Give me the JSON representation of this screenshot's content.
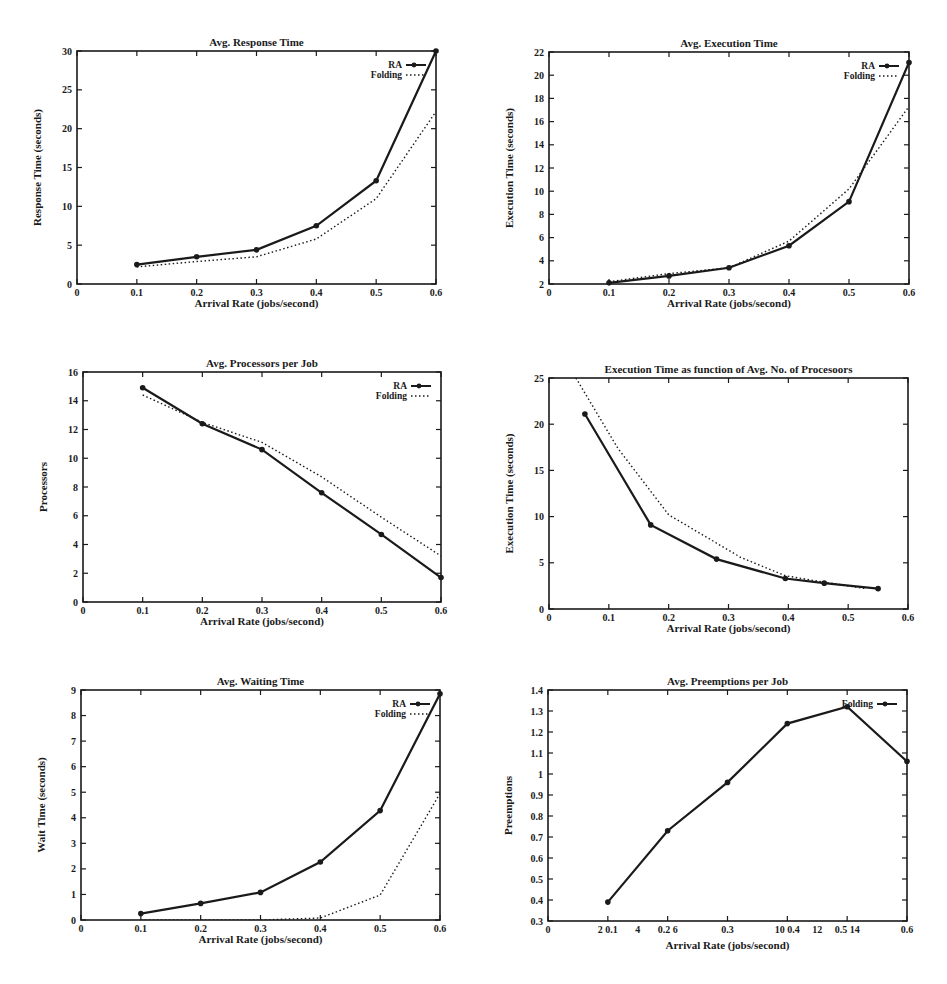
{
  "chart_data": [
    {
      "id": "avg-response-time",
      "type": "line",
      "title": "Avg. Response Time",
      "xlabel": "Arrival Rate (jobs/second)",
      "ylabel": "Response Time (seconds)",
      "xlim": [
        0,
        0.6
      ],
      "ylim": [
        0,
        30
      ],
      "xticks": [
        0,
        0.1,
        0.2,
        0.3,
        0.4,
        0.5,
        0.6
      ],
      "xtick_labels": [
        "0",
        "0.1",
        "0.2",
        "0.3",
        "0.4",
        "0.5",
        "0.6"
      ],
      "yticks": [
        0,
        5,
        10,
        15,
        20,
        25,
        30
      ],
      "ytick_labels": [
        "0",
        "5",
        "10",
        "15",
        "20",
        "25",
        "30"
      ],
      "grid": false,
      "legend_position": "top-right",
      "series": [
        {
          "name": "RA",
          "style": "solid-marker",
          "x": [
            0.1,
            0.2,
            0.3,
            0.4,
            0.5,
            0.6
          ],
          "y": [
            2.5,
            3.5,
            4.4,
            7.5,
            13.3,
            30.0
          ]
        },
        {
          "name": "Folding",
          "style": "dotted",
          "x": [
            0.1,
            0.2,
            0.3,
            0.4,
            0.5,
            0.6
          ],
          "y": [
            2.2,
            2.9,
            3.5,
            5.8,
            11.0,
            22.2
          ]
        }
      ]
    },
    {
      "id": "avg-execution-time",
      "type": "line",
      "title": "Avg. Execution Time",
      "xlabel": "Arrival Rate (jobs/second)",
      "ylabel": "Execution Time (seconds)",
      "xlim": [
        0,
        0.6
      ],
      "ylim": [
        2,
        22
      ],
      "xticks": [
        0,
        0.1,
        0.2,
        0.3,
        0.4,
        0.5,
        0.6
      ],
      "xtick_labels": [
        "0",
        "0.1",
        "0.2",
        "0.3",
        "0.4",
        "0.5",
        "0.6"
      ],
      "yticks": [
        2,
        4,
        6,
        8,
        10,
        12,
        14,
        16,
        18,
        20,
        22
      ],
      "ytick_labels": [
        "2",
        "4",
        "6",
        "8",
        "10",
        "12",
        "14",
        "16",
        "18",
        "20",
        "22"
      ],
      "grid": false,
      "legend_position": "top-right",
      "series": [
        {
          "name": "RA",
          "style": "solid-marker",
          "x": [
            0.1,
            0.2,
            0.3,
            0.4,
            0.5,
            0.6
          ],
          "y": [
            2.1,
            2.7,
            3.4,
            5.3,
            9.1,
            21.1
          ]
        },
        {
          "name": "Folding",
          "style": "dotted",
          "x": [
            0.1,
            0.2,
            0.3,
            0.4,
            0.5,
            0.6
          ],
          "y": [
            2.2,
            2.9,
            3.4,
            5.7,
            10.2,
            17.3
          ]
        }
      ]
    },
    {
      "id": "avg-processors-per-job",
      "type": "line",
      "title": "Avg. Processors per Job",
      "xlabel": "Arrival Rate (jobs/second)",
      "ylabel": "Processors",
      "xlim": [
        0,
        0.6
      ],
      "ylim": [
        0,
        16
      ],
      "xticks": [
        0,
        0.1,
        0.2,
        0.3,
        0.4,
        0.5,
        0.6
      ],
      "xtick_labels": [
        "0",
        "0.1",
        "0.2",
        "0.3",
        "0.4",
        "0.5",
        "0.6"
      ],
      "yticks": [
        0,
        2,
        4,
        6,
        8,
        10,
        12,
        14,
        16
      ],
      "ytick_labels": [
        "0",
        "2",
        "4",
        "6",
        "8",
        "10",
        "12",
        "14",
        "16"
      ],
      "grid": false,
      "legend_position": "top-right",
      "series": [
        {
          "name": "RA",
          "style": "solid-marker",
          "x": [
            0.1,
            0.2,
            0.3,
            0.4,
            0.5,
            0.6
          ],
          "y": [
            14.9,
            12.4,
            10.6,
            7.6,
            4.7,
            1.7
          ]
        },
        {
          "name": "Folding",
          "style": "dotted",
          "x": [
            0.1,
            0.2,
            0.3,
            0.4,
            0.5,
            0.6
          ],
          "y": [
            14.4,
            12.5,
            11.1,
            8.7,
            5.9,
            3.2
          ]
        }
      ]
    },
    {
      "id": "execution-time-vs-processors",
      "type": "line",
      "title": "Execution Time as function of Avg. No. of Procesoors",
      "xlabel": "Arrival Rate (jobs/second)",
      "ylabel": "Execution Time (seconds)",
      "xlim": [
        0,
        0.6
      ],
      "ylim": [
        0,
        25
      ],
      "xticks": [
        0,
        0.1,
        0.2,
        0.3,
        0.4,
        0.5,
        0.6
      ],
      "xtick_labels": [
        "0",
        "0.1",
        "0.2",
        "0.3",
        "0.4",
        "0.5",
        "0.6"
      ],
      "yticks": [
        0,
        5,
        10,
        15,
        20,
        25
      ],
      "ytick_labels": [
        "0",
        "5",
        "10",
        "15",
        "20",
        "25"
      ],
      "grid": false,
      "legend_position": "none",
      "series": [
        {
          "name": "RA",
          "style": "solid-marker",
          "x": [
            0.06,
            0.17,
            0.28,
            0.395,
            0.46,
            0.55
          ],
          "y": [
            21.1,
            9.1,
            5.4,
            3.3,
            2.8,
            2.2
          ]
        },
        {
          "name": "Folding",
          "style": "dotted",
          "x": [
            0.045,
            0.115,
            0.2,
            0.32,
            0.395,
            0.46,
            0.53
          ],
          "y": [
            25.0,
            17.4,
            10.2,
            5.6,
            3.6,
            2.9,
            2.2
          ]
        }
      ]
    },
    {
      "id": "avg-waiting-time",
      "type": "line",
      "title": "Avg. Waiting Time",
      "xlabel": "Arrival Rate (jobs/second)",
      "ylabel": "Wait Time (seconds)",
      "xlim": [
        0,
        0.6
      ],
      "ylim": [
        0,
        9
      ],
      "xticks": [
        0,
        0.1,
        0.2,
        0.3,
        0.4,
        0.5,
        0.6
      ],
      "xtick_labels": [
        "0",
        "0.1",
        "0.2",
        "0.3",
        "0.4",
        "0.5",
        "0.6"
      ],
      "yticks": [
        0,
        1,
        2,
        3,
        4,
        5,
        6,
        7,
        8,
        9
      ],
      "ytick_labels": [
        "0",
        "1",
        "2",
        "3",
        "4",
        "5",
        "6",
        "7",
        "8",
        "9"
      ],
      "grid": false,
      "legend_position": "top-right",
      "series": [
        {
          "name": "RA",
          "style": "solid-marker",
          "x": [
            0.1,
            0.2,
            0.3,
            0.4,
            0.5,
            0.6
          ],
          "y": [
            0.25,
            0.65,
            1.08,
            2.27,
            4.28,
            8.85
          ]
        },
        {
          "name": "Folding",
          "style": "dotted",
          "x": [
            0.1,
            0.2,
            0.3,
            0.4,
            0.5,
            0.6
          ],
          "y": [
            0.0,
            0.0,
            0.0,
            0.08,
            0.98,
            4.95
          ]
        }
      ]
    },
    {
      "id": "avg-preemptions-per-job",
      "type": "line",
      "title": "Avg. Preemptions per Job",
      "xlabel": "Arrival Rate (jobs/second)",
      "ylabel": "Preemptions",
      "xlim": [
        0,
        0.6
      ],
      "ylim": [
        0.3,
        1.4
      ],
      "xticks": [
        0,
        0.1,
        0.2,
        0.3,
        0.4,
        0.5,
        0.6
      ],
      "xtick_labels": [
        "0",
        "2 0.1",
        "4",
        "0.2 6",
        "0.3",
        "10 0.4",
        "12",
        "0.5 14",
        "0.6"
      ],
      "xtick_label_positions": [
        0,
        0.1,
        0.15,
        0.2,
        0.3,
        0.4,
        0.45,
        0.5,
        0.6
      ],
      "yticks": [
        0.3,
        0.4,
        0.5,
        0.6,
        0.7,
        0.8,
        0.9,
        1.0,
        1.1,
        1.2,
        1.3,
        1.4
      ],
      "ytick_labels": [
        "0.3",
        "0.4",
        "0.5",
        "0.6",
        "0.7",
        "0.8",
        "0.9",
        "1",
        "1.1",
        "1.2",
        "1.3",
        "1.4"
      ],
      "grid": false,
      "legend_position": "top-right",
      "series": [
        {
          "name": "Folding",
          "style": "solid-marker",
          "x": [
            0.1,
            0.2,
            0.3,
            0.4,
            0.5,
            0.6
          ],
          "y": [
            0.39,
            0.73,
            0.96,
            1.24,
            1.32,
            1.06
          ]
        }
      ]
    }
  ],
  "layout": [
    {
      "plot": [
        77,
        51,
        436,
        284
      ]
    },
    {
      "plot": [
        549,
        52,
        909,
        284
      ]
    },
    {
      "plot": [
        83,
        372,
        441,
        602
      ]
    },
    {
      "plot": [
        549,
        378,
        908,
        609
      ]
    },
    {
      "plot": [
        81,
        690,
        440,
        920
      ]
    },
    {
      "plot": [
        548,
        690,
        907,
        921
      ]
    }
  ],
  "colors": {
    "line": "#1a1a1a",
    "background": "#ffffff",
    "axis": "#1a1a1a"
  }
}
